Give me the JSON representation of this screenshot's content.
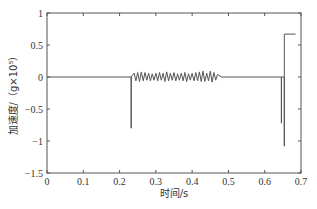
{
  "chart_data": {
    "type": "line",
    "title": "",
    "xlabel": "时间/s",
    "ylabel": "加速度/（g×10⁵）",
    "xlim": [
      0,
      0.7
    ],
    "ylim": [
      -1.5,
      1
    ],
    "x_ticks": [
      0,
      0.1,
      0.2,
      0.3,
      0.4,
      0.5,
      0.6,
      0.7
    ],
    "x_tick_labels": [
      "0",
      "0.1",
      "0.2",
      "0.3",
      "0.4",
      "0.5",
      "0.6",
      "0.7"
    ],
    "y_ticks": [
      1,
      0.5,
      0,
      -0.5,
      -1,
      -1.5
    ],
    "y_tick_labels": [
      "1",
      "0.5",
      "0",
      "-0.5",
      "-1",
      "-1.5"
    ],
    "grid": false,
    "legend": null,
    "series": [
      {
        "name": "acceleration",
        "color": "#555555",
        "description": "Baseline at 0; negative spike ~-0.8 at t≈0.232 s; small oscillations (±~0.08) from t≈0.232 to 0.48 s; negative spike ~-0.72 at t≈0.646 s; spike from ~-1.08 up to ~0.67 at t≈0.654 s, holding ~0.67 until t≈0.685 s",
        "points": [
          [
            0,
            0
          ],
          [
            0.232,
            0
          ],
          [
            0.232,
            -0.8
          ],
          [
            0.232,
            0
          ],
          [
            0.24,
            0.06
          ],
          [
            0.245,
            -0.06
          ],
          [
            0.25,
            0.07
          ],
          [
            0.255,
            -0.07
          ],
          [
            0.26,
            0.08
          ],
          [
            0.265,
            -0.06
          ],
          [
            0.27,
            0.07
          ],
          [
            0.275,
            -0.05
          ],
          [
            0.28,
            0.06
          ],
          [
            0.285,
            -0.06
          ],
          [
            0.29,
            0.05
          ],
          [
            0.295,
            -0.05
          ],
          [
            0.3,
            0.06
          ],
          [
            0.305,
            -0.06
          ],
          [
            0.31,
            0.07
          ],
          [
            0.315,
            -0.05
          ],
          [
            0.32,
            0.06
          ],
          [
            0.325,
            -0.07
          ],
          [
            0.33,
            0.08
          ],
          [
            0.335,
            -0.06
          ],
          [
            0.34,
            0.06
          ],
          [
            0.345,
            -0.05
          ],
          [
            0.35,
            0.07
          ],
          [
            0.355,
            -0.06
          ],
          [
            0.36,
            0.05
          ],
          [
            0.365,
            -0.05
          ],
          [
            0.37,
            0.06
          ],
          [
            0.375,
            -0.06
          ],
          [
            0.38,
            0.07
          ],
          [
            0.385,
            -0.07
          ],
          [
            0.39,
            0.05
          ],
          [
            0.395,
            -0.05
          ],
          [
            0.4,
            0.06
          ],
          [
            0.405,
            -0.06
          ],
          [
            0.41,
            0.07
          ],
          [
            0.415,
            -0.06
          ],
          [
            0.42,
            0.08
          ],
          [
            0.425,
            -0.07
          ],
          [
            0.43,
            0.09
          ],
          [
            0.435,
            -0.07
          ],
          [
            0.44,
            0.06
          ],
          [
            0.445,
            -0.06
          ],
          [
            0.45,
            0.09
          ],
          [
            0.455,
            -0.08
          ],
          [
            0.46,
            0.07
          ],
          [
            0.465,
            -0.05
          ],
          [
            0.47,
            0.04
          ],
          [
            0.48,
            0
          ],
          [
            0.646,
            0
          ],
          [
            0.646,
            -0.72
          ],
          [
            0.646,
            0
          ],
          [
            0.654,
            0
          ],
          [
            0.654,
            -1.08
          ],
          [
            0.654,
            0.67
          ],
          [
            0.685,
            0.67
          ]
        ]
      }
    ]
  }
}
